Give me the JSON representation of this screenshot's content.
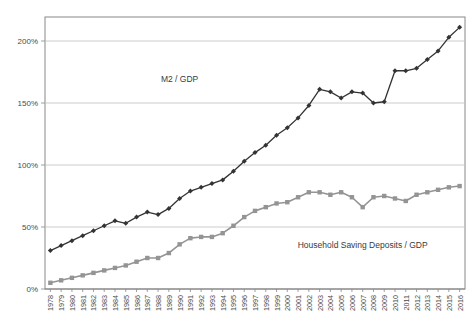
{
  "chart_data": {
    "type": "line",
    "title": "",
    "subtitle": "",
    "xlabel": "",
    "ylabel": "",
    "grid": true,
    "legend_position": "inline-annotation",
    "ylim": [
      0,
      225
    ],
    "ytick_values": [
      0,
      50,
      100,
      150,
      200
    ],
    "ytick_labels": [
      "0%",
      "50%",
      "100%",
      "150%",
      "200%"
    ],
    "categories": [
      "1978",
      "1979",
      "1980",
      "1981",
      "1982",
      "1983",
      "1984",
      "1985",
      "1986",
      "1987",
      "1988",
      "1989",
      "1990",
      "1991",
      "1992",
      "1993",
      "1994",
      "1995",
      "1996",
      "1997",
      "1998",
      "1999",
      "2000",
      "2001",
      "2002",
      "2003",
      "2004",
      "2005",
      "2006",
      "2007",
      "2008",
      "2009",
      "2010",
      "2011",
      "2012",
      "2013",
      "2014",
      "2015",
      "2016"
    ],
    "series": [
      {
        "name": "M2 / GDP",
        "color": "#333333",
        "marker": "diamond",
        "label_x": 1989.5,
        "label_y": 167,
        "values": [
          31,
          35,
          39,
          43,
          47,
          51,
          55,
          53,
          58,
          62,
          60,
          65,
          73,
          79,
          82,
          85,
          88,
          95,
          103,
          110,
          116,
          124,
          130,
          138,
          148,
          161,
          159,
          154,
          159,
          158,
          150,
          151,
          176,
          176,
          178,
          185,
          192,
          203,
          211
        ]
      },
      {
        "name": "Household Saving Deposits / GDP",
        "color": "#949494",
        "marker": "square",
        "label_x": 2006.5,
        "label_y": 33,
        "values": [
          5,
          7,
          9,
          11,
          13,
          15,
          17,
          19,
          22,
          25,
          25,
          29,
          36,
          41,
          42,
          42,
          45,
          51,
          58,
          63,
          66,
          69,
          70,
          74,
          78,
          78,
          76,
          78,
          74,
          66,
          74,
          75,
          73,
          71,
          76,
          78,
          80,
          82,
          83
        ]
      }
    ]
  }
}
